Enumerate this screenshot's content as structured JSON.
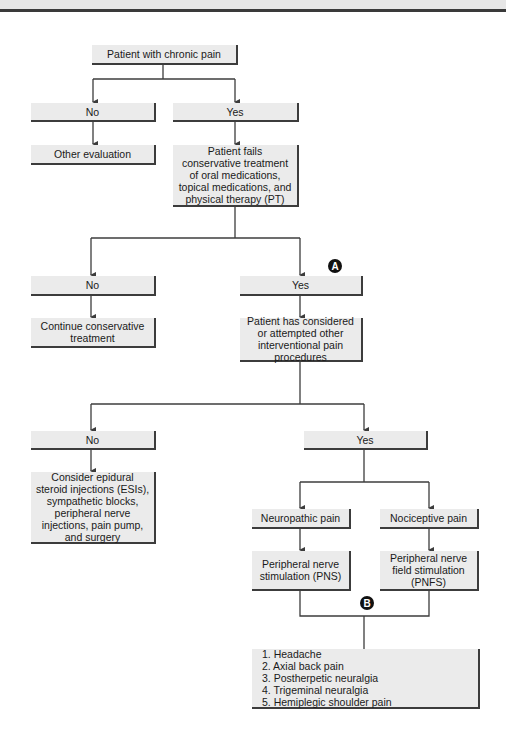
{
  "flowchart": {
    "start": "Patient with chronic pain",
    "level1": {
      "no": "No",
      "no_outcome": "Other evaluation",
      "yes": "Yes",
      "yes_outcome": "Patient fails conservative treatment of oral medications, topical medications, and physical therapy (PT)"
    },
    "level2": {
      "marker": "A",
      "no": "No",
      "no_outcome": "Continue conservative treatment",
      "yes": "Yes",
      "yes_outcome": "Patient has considered or attempted other interventional pain procedures"
    },
    "level3": {
      "no": "No",
      "no_outcome": "Consider epidural steroid injections (ESIs), sympathetic blocks, peripheral nerve injections, pain pump, and surgery",
      "yes": "Yes",
      "branches": [
        {
          "type": "Neuropathic pain",
          "treatment": "Peripheral nerve stimulation (PNS)"
        },
        {
          "type": "Nociceptive pain",
          "treatment": "Peripheral nerve field stimulation (PNFS)"
        }
      ]
    },
    "level4": {
      "marker": "B",
      "indications": [
        "1. Headache",
        "2. Axial back pain",
        "3. Postherpetic neuralgia",
        "4. Trigeminal neuralgia",
        "5. Hemiplegic shoulder pain"
      ]
    }
  },
  "colors": {
    "box_fill": "#ebebeb",
    "line": "#3c3c3c",
    "marker": "#111111"
  }
}
